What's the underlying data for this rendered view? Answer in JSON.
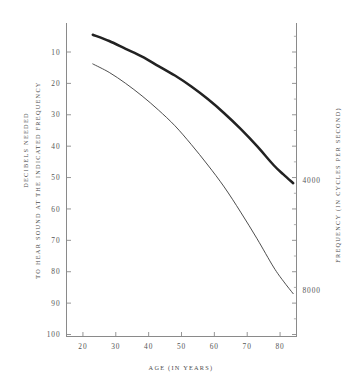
{
  "chart_data": {
    "type": "line",
    "title": "",
    "xlabel": "AGE (IN YEARS)",
    "ylabel_line1": "DECIBELS NEEDED",
    "ylabel_line2": "TO HEAR SOUND AT THE INDICATED FREQUENCY",
    "y2label": "FREQUENCY (IN CYCLES PER SECOND)",
    "xlim": [
      15,
      85
    ],
    "ylim": [
      0,
      100
    ],
    "y_inverted": true,
    "grid": false,
    "legend": "none",
    "xticks": [
      20,
      30,
      40,
      50,
      60,
      70,
      80
    ],
    "xtick_labels": [
      "20",
      "30",
      "40",
      "50",
      "60",
      "70",
      "80"
    ],
    "yticks": [
      10,
      20,
      30,
      40,
      50,
      60,
      70,
      80,
      90,
      100
    ],
    "ytick_labels": [
      "10",
      "20",
      "30",
      "40",
      "50",
      "60",
      "70",
      "80",
      "90",
      "100"
    ],
    "y2_annotations": [
      {
        "label": "4000",
        "decibels": 51
      },
      {
        "label": "8000",
        "decibels": 86
      }
    ],
    "series": [
      {
        "name": "4000",
        "style": "thick",
        "color": "#222222",
        "x": [
          23,
          28,
          33,
          38,
          43,
          48,
          53,
          58,
          63,
          68,
          73,
          78,
          81,
          84
        ],
        "values": [
          4.5,
          6.5,
          9.0,
          11.5,
          14.5,
          17.5,
          21.0,
          25.0,
          29.5,
          34.5,
          40.0,
          46.0,
          49.0,
          51.8
        ]
      },
      {
        "name": "8000",
        "style": "thin",
        "color": "#3a3a3a",
        "x": [
          23,
          28,
          33,
          38,
          43,
          48,
          53,
          58,
          63,
          68,
          73,
          78,
          81,
          84
        ],
        "values": [
          13.8,
          16.5,
          20.0,
          24.0,
          28.5,
          33.5,
          39.5,
          46.0,
          53.0,
          61.0,
          69.5,
          78.5,
          83.0,
          87.0
        ]
      }
    ]
  }
}
